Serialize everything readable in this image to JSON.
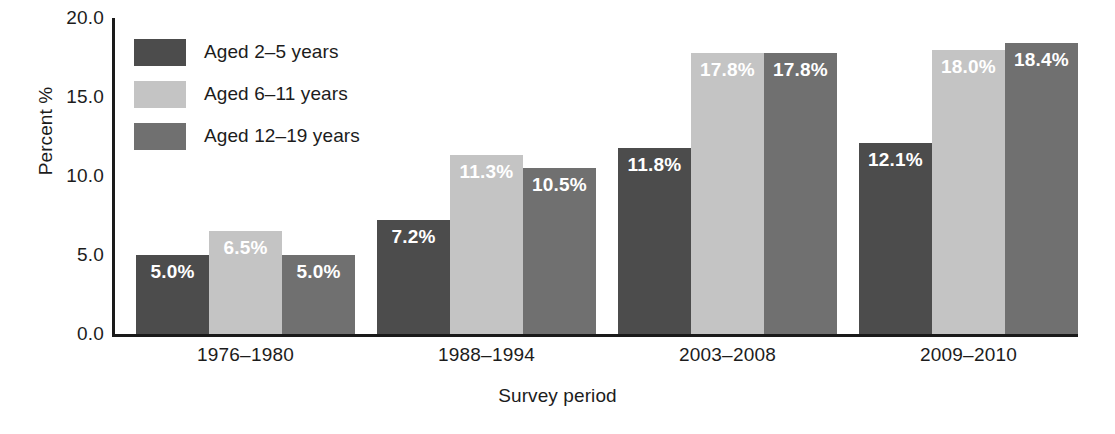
{
  "chart_data": {
    "type": "bar",
    "title": "",
    "xlabel": "Survey period",
    "ylabel": "Percent %",
    "categories": [
      "1976–1980",
      "1988–1994",
      "2003–2008",
      "2009–2010"
    ],
    "ylim": [
      0.0,
      20.0
    ],
    "yticks": [
      "20.0",
      "15.0",
      "10.0",
      "5.0",
      "0.0"
    ],
    "ytick_values": [
      20.0,
      15.0,
      10.0,
      5.0,
      0.0
    ],
    "grid": false,
    "legend_position": "upper-left-inside",
    "series": [
      {
        "name": "Aged 2–5 years",
        "color": "#4c4c4c",
        "values": [
          5.0,
          7.2,
          11.8,
          12.1
        ],
        "labels": [
          "5.0%",
          "7.2%",
          "11.8%",
          "12.1%"
        ]
      },
      {
        "name": "Aged 6–11 years",
        "color": "#c4c4c4",
        "values": [
          6.5,
          11.3,
          17.8,
          18.0
        ],
        "labels": [
          "6.5%",
          "11.3%",
          "17.8%",
          "18.0%"
        ]
      },
      {
        "name": "Aged 12–19 years",
        "color": "#707070",
        "values": [
          5.0,
          10.5,
          17.8,
          18.4
        ],
        "labels": [
          "5.0%",
          "10.5%",
          "17.8%",
          "18.4%"
        ]
      }
    ]
  },
  "legend": {
    "items": [
      {
        "label": "Aged 2–5 years",
        "color": "#4c4c4c"
      },
      {
        "label": "Aged 6–11 years",
        "color": "#c4c4c4"
      },
      {
        "label": "Aged 12–19 years",
        "color": "#707070"
      }
    ]
  }
}
